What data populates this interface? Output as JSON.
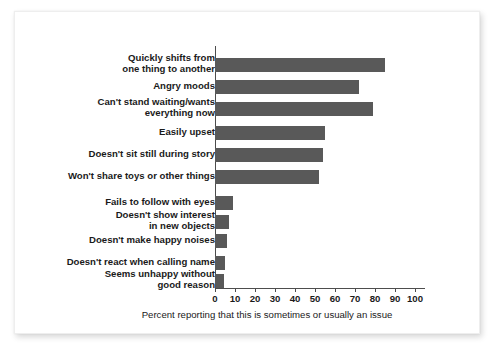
{
  "chart_data": {
    "type": "bar",
    "orientation": "horizontal",
    "title": "",
    "subtitle": "",
    "xlabel": "Percent reporting that this is sometimes or usually an issue",
    "ylabel": "",
    "xlim": [
      0,
      100
    ],
    "xticks": [
      0,
      10,
      20,
      30,
      40,
      50,
      60,
      70,
      80,
      90,
      100
    ],
    "xtick_labels": [
      "0",
      "10",
      "20",
      "30",
      "40",
      "50",
      "60",
      "70",
      "80",
      "90",
      "100"
    ],
    "grid": false,
    "legend": null,
    "bar_color": "#595959",
    "axis_color": "#4d4d4d",
    "categories": [
      "Quickly shifts from\none thing to another",
      "Angry moods",
      "Can't stand waiting/wants\neverything now",
      "Easily upset",
      "Doesn't sit still during story",
      "Won't share toys or other things",
      "Fails to follow with eyes",
      "Doesn't show interest\nin new objects",
      "Doesn't make happy noises",
      "Doesn't react when calling name",
      "Seems unhappy without\ngood reason"
    ],
    "values": [
      85,
      72,
      79,
      55,
      54,
      52,
      9,
      7,
      6,
      5,
      4.5
    ]
  },
  "caption": {
    "x_axis": "Percent reporting that this is sometimes or usually an issue"
  }
}
